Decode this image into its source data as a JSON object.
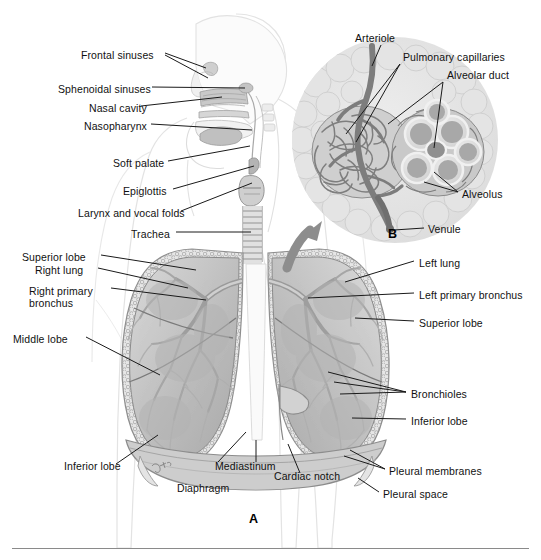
{
  "figure": {
    "title_absent": true,
    "panels": [
      {
        "id": "A",
        "letter": "A",
        "description": "Anterior view of respiratory tract with lungs in thorax"
      },
      {
        "id": "B",
        "letter": "B",
        "description": "Magnified alveolar cluster with pulmonary circulation"
      }
    ]
  },
  "colors": {
    "background": "#ffffff",
    "label_text": "#111111",
    "leader_line": "#1a1a1a",
    "body_outline": "#dedede",
    "tissue_light": "#e2e2e2",
    "tissue_mid": "#c3c3c3",
    "tissue_dark": "#9a9a9a",
    "tissue_darker": "#7e7e7e",
    "vessel_gray": "#8c8c8c",
    "rule": "#8a8a8a"
  },
  "labels_upper_left": [
    {
      "id": "frontal-sinuses",
      "text": "Frontal sinuses",
      "x": 81,
      "y": 56
    },
    {
      "id": "sphenoidal-sinuses",
      "text": "Sphenoidal sinuses",
      "x": 58,
      "y": 90
    },
    {
      "id": "nasal-cavity",
      "text": "Nasal cavity",
      "x": 89,
      "y": 109
    },
    {
      "id": "nasopharynx",
      "text": "Nasopharynx",
      "x": 84,
      "y": 127
    },
    {
      "id": "soft-palate",
      "text": "Soft palate",
      "x": 113,
      "y": 164
    },
    {
      "id": "epiglottis",
      "text": "Epiglottis",
      "x": 123,
      "y": 192
    },
    {
      "id": "larynx-vocal-folds",
      "text": "Larynx and vocal folds",
      "x": 78,
      "y": 214
    },
    {
      "id": "trachea",
      "text": "Trachea",
      "x": 131,
      "y": 235
    }
  ],
  "labels_lower_left": [
    {
      "id": "superior-lobe-right",
      "text": "Superior lobe",
      "x": 22,
      "y": 258
    },
    {
      "id": "right-lung",
      "text": "Right lung",
      "x": 35,
      "y": 271
    },
    {
      "id": "right-primary-bronchus",
      "text": "Right primary bronchus",
      "x": 29,
      "y": 292
    },
    {
      "id": "middle-lobe",
      "text": "Middle lobe",
      "x": 13,
      "y": 340
    },
    {
      "id": "inferior-lobe-right",
      "text": "Inferior lobe",
      "x": 64,
      "y": 467
    }
  ],
  "labels_lower_right": [
    {
      "id": "left-lung",
      "text": "Left lung",
      "x": 419,
      "y": 264
    },
    {
      "id": "left-primary-bronchus",
      "text": "Left primary bronchus",
      "x": 419,
      "y": 296
    },
    {
      "id": "superior-lobe-left",
      "text": "Superior lobe",
      "x": 419,
      "y": 324
    },
    {
      "id": "bronchioles",
      "text": "Bronchioles",
      "x": 411,
      "y": 395
    },
    {
      "id": "inferior-lobe-left",
      "text": "Inferior lobe",
      "x": 411,
      "y": 422
    },
    {
      "id": "pleural-membranes",
      "text": "Pleural membranes",
      "x": 389,
      "y": 472
    },
    {
      "id": "pleural-space",
      "text": "Pleural space",
      "x": 383,
      "y": 495
    }
  ],
  "labels_bottom_center": [
    {
      "id": "mediastinum",
      "text": "Mediastinum",
      "x": 215,
      "y": 467
    },
    {
      "id": "cardiac-notch",
      "text": "Cardiac notch",
      "x": 274,
      "y": 477
    },
    {
      "id": "diaphragm",
      "text": "Diaphragm",
      "x": 177,
      "y": 489
    }
  ],
  "labels_inset_b": [
    {
      "id": "arteriole",
      "text": "Arteriole",
      "x": 355,
      "y": 39
    },
    {
      "id": "pulmonary-capillaries",
      "text": "Pulmonary capillaries",
      "x": 403,
      "y": 58
    },
    {
      "id": "alveolar-duct",
      "text": "Alveolar duct",
      "x": 447,
      "y": 76
    },
    {
      "id": "alveolus",
      "text": "Alveolus",
      "x": 462,
      "y": 195
    },
    {
      "id": "venule",
      "text": "Venule",
      "x": 428,
      "y": 230
    }
  ],
  "panel_letters": [
    {
      "id": "panel-a",
      "text": "A",
      "x": 249,
      "y": 519
    },
    {
      "id": "panel-b",
      "text": "B",
      "x": 388,
      "y": 234
    }
  ]
}
